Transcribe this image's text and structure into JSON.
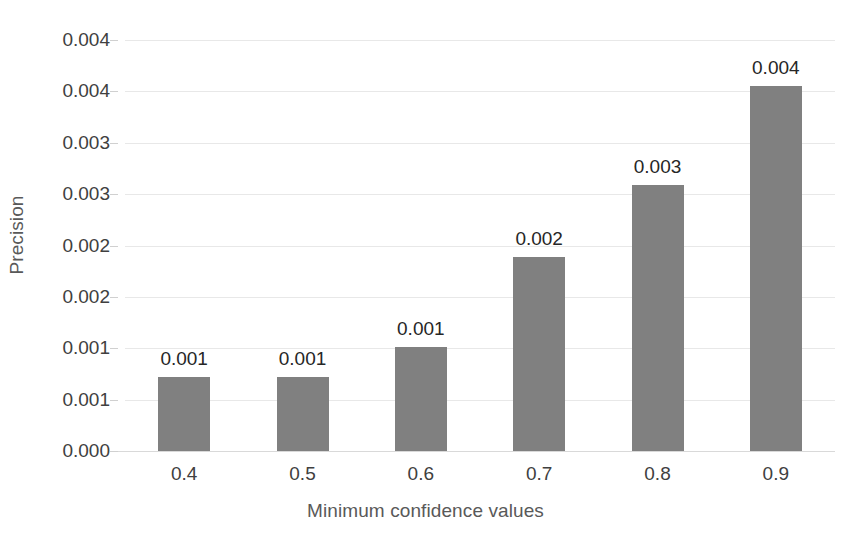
{
  "chart_data": {
    "type": "bar",
    "title": "",
    "xlabel": "Minimum confidence values",
    "ylabel": "Precision",
    "categories": [
      "0.4",
      "0.5",
      "0.6",
      "0.7",
      "0.8",
      "0.9"
    ],
    "values": [
      0.00072,
      0.00072,
      0.00101,
      0.00189,
      0.00259,
      0.00355
    ],
    "data_labels": [
      "0.001",
      "0.001",
      "0.001",
      "0.002",
      "0.003",
      "0.004"
    ],
    "ylim": [
      0.0,
      0.004
    ],
    "ytick_values": [
      0.0,
      0.0005,
      0.001,
      0.0015,
      0.002,
      0.0025,
      0.003,
      0.0035,
      0.004
    ],
    "ytick_labels": [
      "0.000",
      "0.001",
      "0.001",
      "0.002",
      "0.002",
      "0.003",
      "0.003",
      "0.004",
      "0.004"
    ],
    "grid": true,
    "legend": null,
    "series_color": "#808080",
    "gridline_color": "#e8e8e8",
    "axis_color": "#d9d9d9",
    "text_color": "#404040"
  }
}
